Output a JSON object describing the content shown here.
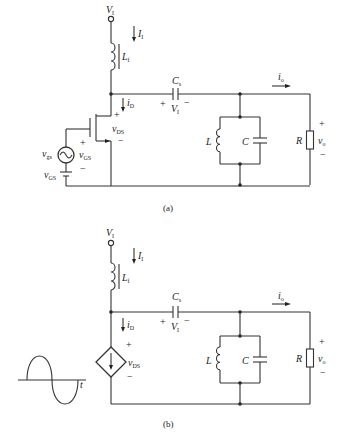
{
  "figure_a": {
    "caption": "(a)",
    "supply": {
      "symbol": "V",
      "sub": "I"
    },
    "supply_current": {
      "symbol": "I",
      "sub": "I"
    },
    "choke": {
      "symbol": "L",
      "sub": "f"
    },
    "drain_current": {
      "symbol": "i",
      "sub": "D"
    },
    "vds": {
      "symbol": "v",
      "sub": "DS",
      "plus": "+",
      "minus": "−"
    },
    "coupling_cap": {
      "symbol": "C",
      "sub": "s"
    },
    "cap_voltage": {
      "symbol": "V",
      "sub": "I",
      "plus": "+",
      "minus": "−"
    },
    "output_current": {
      "symbol": "i",
      "sub": "o"
    },
    "tank_inductor": "L",
    "tank_capacitor": "C",
    "load": "R",
    "output_voltage": {
      "symbol": "v",
      "sub": "o",
      "plus": "+",
      "minus": "−"
    },
    "gate_source": {
      "symbol": "v",
      "sub": "gs"
    },
    "vgs": {
      "symbol": "v",
      "sub": "GS",
      "plus": "+",
      "minus": "−"
    },
    "bias": {
      "symbol": "v",
      "sub": "GS"
    }
  },
  "figure_b": {
    "caption": "(b)",
    "supply": {
      "symbol": "V",
      "sub": "I"
    },
    "supply_current": {
      "symbol": "I",
      "sub": "I"
    },
    "choke": {
      "symbol": "L",
      "sub": "f"
    },
    "drain_current": {
      "symbol": "i",
      "sub": "D"
    },
    "vds": {
      "symbol": "v",
      "sub": "DS",
      "plus": "+",
      "minus": "−"
    },
    "coupling_cap": {
      "symbol": "C",
      "sub": "s"
    },
    "cap_voltage": {
      "symbol": "V",
      "sub": "I",
      "plus": "+",
      "minus": "−"
    },
    "output_current": {
      "symbol": "i",
      "sub": "o"
    },
    "tank_inductor": "L",
    "tank_capacitor": "C",
    "load": "R",
    "output_voltage": {
      "symbol": "v",
      "sub": "o",
      "plus": "+",
      "minus": "−"
    },
    "waveform_axis": "t"
  }
}
